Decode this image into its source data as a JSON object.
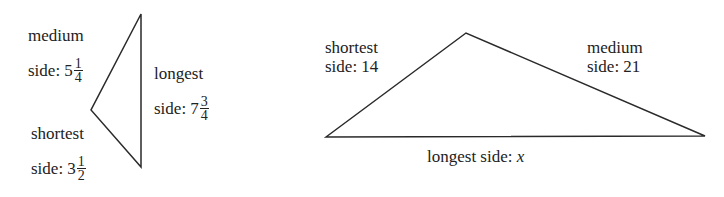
{
  "figures": [
    {
      "id": "triangle-1",
      "vertices": {
        "top": [
          141,
          14
        ],
        "left": [
          91,
          110
        ],
        "bottom": [
          141,
          167
        ]
      },
      "labels": {
        "medium": {
          "line1": "medium",
          "prefix": "side: ",
          "whole": "5",
          "num": "1",
          "den": "4"
        },
        "longest": {
          "line1": "longest",
          "prefix": "side: ",
          "whole": "7",
          "num": "3",
          "den": "4"
        },
        "shortest": {
          "line1": "shortest",
          "prefix": "side: ",
          "whole": "3",
          "num": "1",
          "den": "2"
        }
      }
    },
    {
      "id": "triangle-2",
      "vertices": {
        "left": [
          326,
          137
        ],
        "top": [
          466,
          33
        ],
        "right": [
          705,
          136
        ]
      },
      "labels": {
        "shortest": {
          "line1": "shortest",
          "line2": "side: 14"
        },
        "medium": {
          "line1": "medium",
          "line2": "side: 21"
        },
        "longest": {
          "prefix": "longest side: ",
          "var": "x"
        }
      }
    }
  ],
  "colors": {
    "stroke": "#2a2a2a",
    "text": "#222222",
    "background": "#ffffff"
  }
}
